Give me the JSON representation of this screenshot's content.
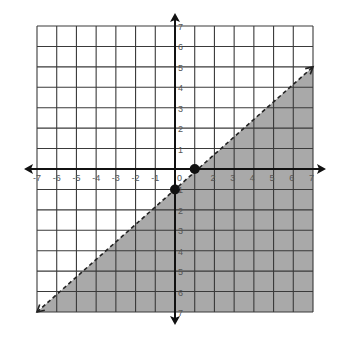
{
  "chart_data": {
    "type": "line",
    "title": "",
    "xlabel": "",
    "ylabel": "",
    "xlim": [
      -7,
      7
    ],
    "ylim": [
      -7,
      7
    ],
    "grid": true,
    "x_ticks": [
      "-7",
      "-6",
      "-5",
      "-4",
      "-3",
      "-2",
      "-1",
      "0",
      "1",
      "2",
      "3",
      "4",
      "5",
      "6",
      "7"
    ],
    "y_ticks": [
      "7",
      "6",
      "5",
      "4",
      "3",
      "2",
      "1",
      "-1",
      "-2",
      "-3",
      "-4",
      "-5",
      "-6",
      "-7"
    ],
    "x_tick_labels_visible": [
      "-7",
      "-6",
      "-5",
      "-4",
      "-3",
      "-2",
      "-1",
      "0",
      "2",
      "3",
      "4",
      "5",
      "6",
      "7"
    ],
    "y_tick_labels_visible": [
      "7",
      "6",
      "5",
      "4",
      "3",
      "2",
      "1",
      "1",
      "2",
      "3",
      "4",
      "5",
      "6",
      "7"
    ],
    "boundary_line": {
      "style": "dashed",
      "from": [
        -7,
        -7
      ],
      "to": [
        7,
        5
      ],
      "arrows": "both"
    },
    "points": [
      {
        "x": 1,
        "y": 0
      },
      {
        "x": 0,
        "y": -1
      }
    ],
    "shaded_region": "below-right of boundary line",
    "colors": {
      "shade": "#a9a9a9",
      "grid": "#3a3a3a",
      "axis": "#111111",
      "point": "#111111"
    }
  }
}
